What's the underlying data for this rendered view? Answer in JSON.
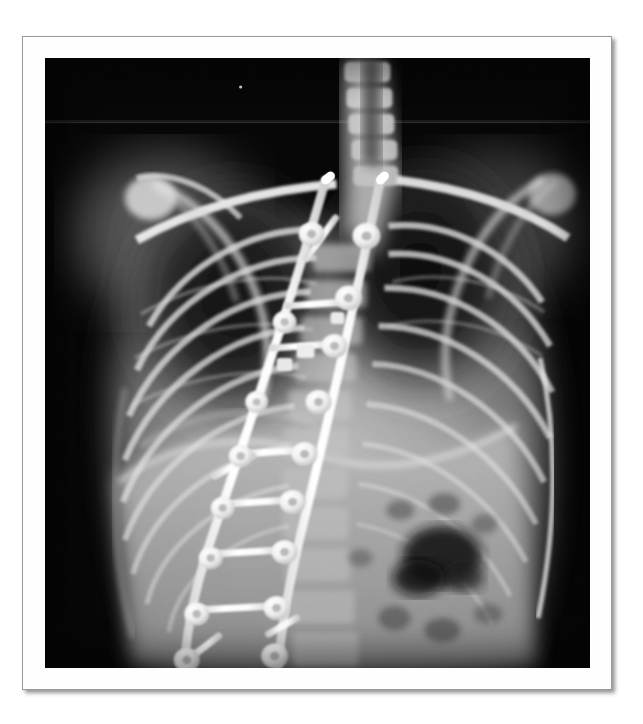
{
  "document": {
    "background_color": "#ffffff",
    "width": 643,
    "height": 724
  },
  "frame": {
    "border_color": "#9a9a9a",
    "matte_color": "#fefefe",
    "shadow": "drop-shadow-lower-right",
    "x": 22,
    "y": 36,
    "width": 590,
    "height": 654
  },
  "figure": {
    "kind": "radiograph",
    "modality": "X-ray",
    "view": "AP (anteroposterior) standing",
    "region": "Thoracolumbar spine and chest",
    "finding": "Scoliosis corrected with posterior spinal instrumentation and fusion",
    "background_color": "#050505",
    "caption": "",
    "annotations": [],
    "text_overlays": [],
    "image": {
      "x": 45,
      "y": 58,
      "width": 546,
      "height": 610
    }
  },
  "anatomy": {
    "structures": [
      {
        "name": "right-clavicle",
        "label": "Right clavicle"
      },
      {
        "name": "left-clavicle",
        "label": "Left clavicle"
      },
      {
        "name": "right-scapula",
        "label": "Right scapula"
      },
      {
        "name": "left-scapula",
        "label": "Left scapula"
      },
      {
        "name": "right-humeral-head",
        "label": "Right humeral head"
      },
      {
        "name": "cervicothoracic-vertebrae",
        "label": "Cervicothoracic vertebrae"
      },
      {
        "name": "rib-cage",
        "label": "Rib cage"
      },
      {
        "name": "right-lung-field",
        "label": "Right lung field"
      },
      {
        "name": "left-lung-field",
        "label": "Left lung field"
      },
      {
        "name": "diaphragm",
        "label": "Diaphragm"
      },
      {
        "name": "gastric-bubble",
        "label": "Gastric bubble / bowel gas"
      },
      {
        "name": "lumbar-vertebrae",
        "label": "Lumbar vertebrae"
      },
      {
        "name": "soft-tissue-shadow",
        "label": "Soft tissue shadow"
      }
    ]
  },
  "hardware": {
    "description": "Bilateral pedicle screw and rod construct",
    "rod_count": 2,
    "cross_connector_count": 4,
    "screw_count": 18,
    "material_color": "#ffffff",
    "components": [
      {
        "name": "left-rod",
        "label": "Left longitudinal rod"
      },
      {
        "name": "right-rod",
        "label": "Right longitudinal rod"
      },
      {
        "name": "pedicle-screws",
        "label": "Pedicle screws"
      },
      {
        "name": "cross-connectors",
        "label": "Transverse cross-connectors"
      },
      {
        "name": "rod-tip-superior",
        "label": "Superior rod tips"
      }
    ]
  },
  "chart_data": {
    "type": "scatter",
    "title": "",
    "xlabel": "",
    "ylabel": "",
    "note": "Not a chart - medical radiograph",
    "categories": [],
    "values": []
  }
}
